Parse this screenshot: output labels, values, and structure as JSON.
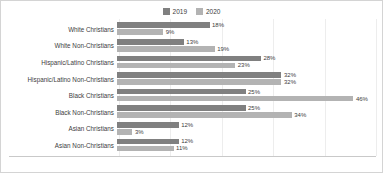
{
  "chart_data": {
    "type": "bar",
    "orientation": "horizontal",
    "title": "",
    "xlabel": "",
    "ylabel": "",
    "grid": true,
    "legend_position": "top-center",
    "xlim": [
      0,
      50
    ],
    "axis_max": 50,
    "categories": [
      "White Christians",
      "White Non-Christians",
      "Hispanic/Latino Christians",
      "Hispanic/Latino Non-Christians",
      "Black Christians",
      "Black Non-Christians",
      "Asian Christians",
      "Asian Non-Christians"
    ],
    "series": [
      {
        "name": "2019",
        "color": "#808080",
        "values": [
          18,
          13,
          28,
          32,
          25,
          25,
          12,
          12
        ],
        "labels": [
          "18%",
          "13%",
          "28%",
          "32%",
          "25%",
          "25%",
          "12%",
          "12%"
        ]
      },
      {
        "name": "2020",
        "color": "#b3b3b3",
        "values": [
          9,
          19,
          23,
          32,
          46,
          34,
          3,
          11
        ],
        "labels": [
          "9%",
          "19%",
          "23%",
          "32%",
          "46%",
          "34%",
          "3%",
          "11%"
        ]
      }
    ]
  },
  "legend": {
    "items": [
      {
        "label": "2019",
        "color": "#808080"
      },
      {
        "label": "2020",
        "color": "#b3b3b3"
      }
    ]
  },
  "colors": {
    "series_2019": "#808080",
    "series_2020": "#b3b3b3",
    "gridline": "#ededed",
    "axis": "#c9c9c9",
    "border": "#d4d4d4",
    "text": "#3d3d3d",
    "background": "#ffffff"
  }
}
